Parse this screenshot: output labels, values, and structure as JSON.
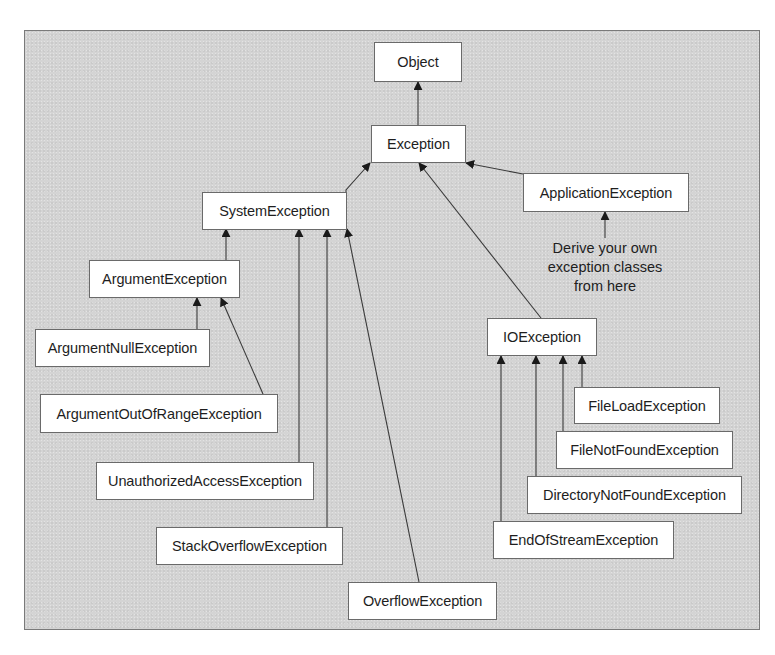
{
  "diagram": {
    "colors": {
      "background_panel": "#d4d4d4",
      "node_fill": "#ffffff",
      "node_border": "#6a6a6a",
      "edge": "#3a3a3a",
      "text": "#1e1e1e"
    },
    "nodes": {
      "object": "Object",
      "exception": "Exception",
      "system_exception": "SystemException",
      "application_exception": "ApplicationException",
      "argument_exception": "ArgumentException",
      "argument_null_exception": "ArgumentNullException",
      "argument_out_of_range_exception": "ArgumentOutOfRangeException",
      "unauthorized_access_exception": "UnauthorizedAccessException",
      "stack_overflow_exception": "StackOverflowException",
      "overflow_exception": "OverflowException",
      "io_exception": "IOException",
      "file_load_exception": "FileLoadException",
      "file_not_found_exception": "FileNotFoundException",
      "directory_not_found_exception": "DirectoryNotFoundException",
      "end_of_stream_exception": "EndOfStreamException"
    },
    "annotation": {
      "lines": [
        "Derive your own",
        "exception classes",
        "from here"
      ]
    },
    "edges": [
      {
        "from": "Exception",
        "to": "Object"
      },
      {
        "from": "SystemException",
        "to": "Exception"
      },
      {
        "from": "ApplicationException",
        "to": "Exception"
      },
      {
        "from": "IOException",
        "to": "Exception"
      },
      {
        "from": "ArgumentException",
        "to": "SystemException"
      },
      {
        "from": "UnauthorizedAccessException",
        "to": "SystemException"
      },
      {
        "from": "StackOverflowException",
        "to": "SystemException"
      },
      {
        "from": "OverflowException",
        "to": "SystemException"
      },
      {
        "from": "ArgumentNullException",
        "to": "ArgumentException"
      },
      {
        "from": "ArgumentOutOfRangeException",
        "to": "ArgumentException"
      },
      {
        "from": "EndOfStreamException",
        "to": "IOException"
      },
      {
        "from": "DirectoryNotFoundException",
        "to": "IOException"
      },
      {
        "from": "FileNotFoundException",
        "to": "IOException"
      },
      {
        "from": "FileLoadException",
        "to": "IOException"
      },
      {
        "from": "annotation",
        "to": "ApplicationException"
      }
    ]
  }
}
